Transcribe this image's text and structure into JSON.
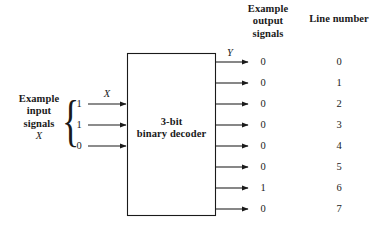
{
  "figure": {
    "title_block": {
      "line1": "3-bit",
      "line2": "binary decoder"
    },
    "input_section": {
      "label_line1": "Example",
      "label_line2": "input",
      "label_line3": "signals",
      "label_line4": "X",
      "brace": "{",
      "bus_label": "X",
      "bits": [
        "1",
        "1",
        "0"
      ]
    },
    "output_section": {
      "header_line1": "Example",
      "header_line2": "output",
      "header_line3": "signals",
      "bus_label": "Y",
      "values": [
        "0",
        "0",
        "0",
        "0",
        "0",
        "0",
        "1",
        "0"
      ]
    },
    "line_number_section": {
      "header": "Line number",
      "values": [
        "0",
        "1",
        "2",
        "3",
        "4",
        "5",
        "6",
        "7"
      ]
    },
    "colors": {
      "background": "#ffffff",
      "stroke": "#1a1a1a",
      "text": "#1a1a1a"
    }
  }
}
